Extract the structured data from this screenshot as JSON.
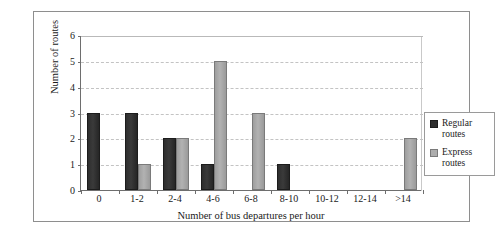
{
  "chart_data": {
    "type": "bar",
    "title": "",
    "xlabel": "Number of bus departures per hour",
    "ylabel": "Number of routes",
    "categories": [
      "0",
      "1-2",
      "2-4",
      "4-6",
      "6-8",
      "8-10",
      "10-12",
      "12-14",
      ">14"
    ],
    "series": [
      {
        "name": "Regular routes",
        "color": "#2e2e2e",
        "values": [
          3,
          3,
          2,
          1,
          0,
          1,
          0,
          0,
          0
        ]
      },
      {
        "name": "Express routes",
        "color": "#adadad",
        "values": [
          0,
          1,
          2,
          5,
          3,
          0,
          0,
          0,
          2
        ]
      }
    ],
    "ylim": [
      0,
      6
    ],
    "yticks": [
      0,
      1,
      2,
      3,
      4,
      5,
      6
    ],
    "ytick_labels": [
      "0",
      "1",
      "2",
      "3",
      "4",
      "5",
      "6"
    ],
    "grid": true,
    "grid_style": "dashed",
    "legend_position": "right"
  },
  "legend": {
    "items": [
      {
        "label_line1": "Regular",
        "label_line2": "routes"
      },
      {
        "label_line1": "Express",
        "label_line2": "routes"
      }
    ]
  }
}
